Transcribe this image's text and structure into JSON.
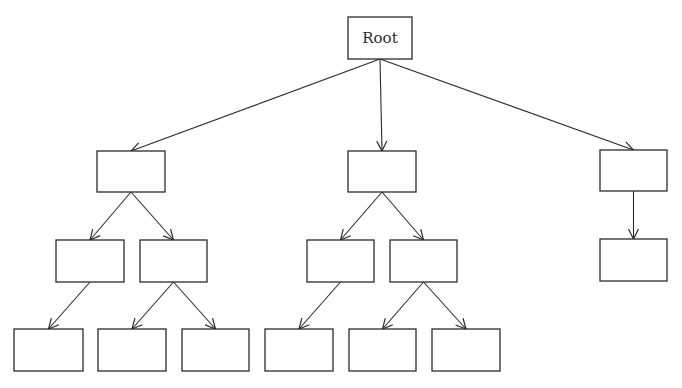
{
  "diagram": {
    "type": "tree",
    "stroke_color": "#2b2b2b",
    "background": "#ffffff",
    "nodes": [
      {
        "id": "root",
        "label": "Root",
        "x": 348,
        "y": 17,
        "w": 64,
        "h": 42
      },
      {
        "id": "a",
        "label": "",
        "x": 97,
        "y": 151,
        "w": 68,
        "h": 41
      },
      {
        "id": "b",
        "label": "",
        "x": 348,
        "y": 151,
        "w": 68,
        "h": 41
      },
      {
        "id": "c",
        "label": "",
        "x": 600,
        "y": 150,
        "w": 67,
        "h": 41
      },
      {
        "id": "a1",
        "label": "",
        "x": 56,
        "y": 240,
        "w": 68,
        "h": 42
      },
      {
        "id": "a2",
        "label": "",
        "x": 140,
        "y": 240,
        "w": 67,
        "h": 42
      },
      {
        "id": "b1",
        "label": "",
        "x": 307,
        "y": 240,
        "w": 67,
        "h": 42
      },
      {
        "id": "b2",
        "label": "",
        "x": 390,
        "y": 240,
        "w": 67,
        "h": 42
      },
      {
        "id": "c1",
        "label": "",
        "x": 600,
        "y": 239,
        "w": 67,
        "h": 42
      },
      {
        "id": "a1a",
        "label": "",
        "x": 14,
        "y": 329,
        "w": 69,
        "h": 42
      },
      {
        "id": "a2a",
        "label": "",
        "x": 98,
        "y": 329,
        "w": 68,
        "h": 42
      },
      {
        "id": "a2b",
        "label": "",
        "x": 182,
        "y": 329,
        "w": 67,
        "h": 42
      },
      {
        "id": "b1a",
        "label": "",
        "x": 265,
        "y": 329,
        "w": 68,
        "h": 42
      },
      {
        "id": "b2a",
        "label": "",
        "x": 349,
        "y": 329,
        "w": 67,
        "h": 42
      },
      {
        "id": "b2b",
        "label": "",
        "x": 432,
        "y": 329,
        "w": 68,
        "h": 42
      }
    ],
    "edges": [
      {
        "from": "root",
        "to": "a"
      },
      {
        "from": "root",
        "to": "b"
      },
      {
        "from": "root",
        "to": "c"
      },
      {
        "from": "a",
        "to": "a1"
      },
      {
        "from": "a",
        "to": "a2"
      },
      {
        "from": "b",
        "to": "b1"
      },
      {
        "from": "b",
        "to": "b2"
      },
      {
        "from": "c",
        "to": "c1"
      },
      {
        "from": "a1",
        "to": "a1a"
      },
      {
        "from": "a2",
        "to": "a2a"
      },
      {
        "from": "a2",
        "to": "a2b"
      },
      {
        "from": "b1",
        "to": "b1a"
      },
      {
        "from": "b2",
        "to": "b2a"
      },
      {
        "from": "b2",
        "to": "b2b"
      }
    ]
  }
}
